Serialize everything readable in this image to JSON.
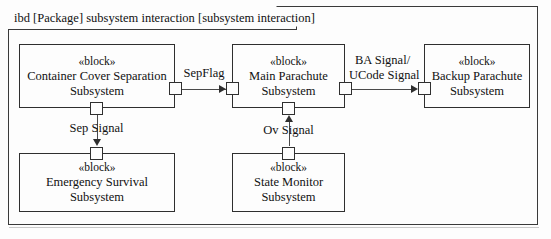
{
  "diagram": {
    "header": "ibd [Package] subsystem interaction [subsystem interaction]",
    "kind": "ibd",
    "stereotype": "« block »"
  },
  "blocks": [
    {
      "id": "container-cover-separation",
      "stereotype": "«block»",
      "name_line1": "Container Cover Separation",
      "name_line2": "Subsystem"
    },
    {
      "id": "main-parachute",
      "stereotype": "«block»",
      "name_line1": "Main Parachute",
      "name_line2": "Subsystem"
    },
    {
      "id": "backup-parachute",
      "stereotype": "«block»",
      "name_line1": "Backup Parachute",
      "name_line2": "Subsystem"
    },
    {
      "id": "emergency-survival",
      "stereotype": "«block»",
      "name_line1": "Emergency Survival",
      "name_line2": "Subsystem"
    },
    {
      "id": "state-monitor",
      "stereotype": "«block»",
      "name_line1": "State Monitor",
      "name_line2": "Subsystem"
    }
  ],
  "connectors": [
    {
      "id": "sepflag",
      "label": "SepFlag",
      "from": "container-cover-separation",
      "to": "main-parachute",
      "direction": "right"
    },
    {
      "id": "ba-ucode",
      "label_line1": "BA Signal/",
      "label_line2": "UCode Signal",
      "from": "main-parachute",
      "to": "backup-parachute",
      "direction": "right"
    },
    {
      "id": "sep-signal",
      "label": "Sep Signal",
      "from": "container-cover-separation",
      "to": "emergency-survival",
      "direction": "down"
    },
    {
      "id": "ov-signal",
      "label": "Ov Signal",
      "from": "state-monitor",
      "to": "main-parachute",
      "direction": "up"
    }
  ],
  "colors": {
    "line": "#2f2f2f",
    "background": "#fdfdfd",
    "text": "#111111"
  }
}
